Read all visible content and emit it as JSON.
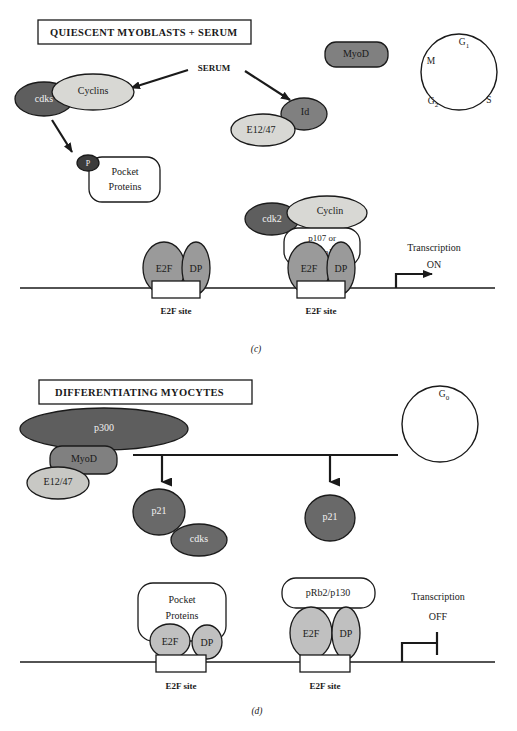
{
  "figure": {
    "panels": [
      {
        "letter": "(c)",
        "title": "QUIESCENT MYOBLASTS + SERUM"
      },
      {
        "letter": "(d)",
        "title": "DIFFERENTIATING MYOCYTES"
      }
    ],
    "caption_partial": ""
  },
  "panel_c": {
    "title": "QUIESCENT MYOBLASTS + SERUM",
    "letter": "(c)",
    "serum_label": "SERUM",
    "nodes": {
      "cdks": "cdks",
      "cyclins": "Cyclins",
      "phospho": "P",
      "pocket_proteins_line1": "Pocket",
      "pocket_proteins_line2": "Proteins",
      "e12_47": "E12/47",
      "id": "Id",
      "myod": "MyoD",
      "cdk2": "cdk2",
      "cyclin": "Cyclin",
      "pocket_variant_line1": "p107 or",
      "pocket_variant_line2": "pRb2/p130",
      "e2f_left": "E2F",
      "dp_left": "DP",
      "e2f_right": "E2F",
      "dp_right": "DP"
    },
    "dna": {
      "site_left": "E2F site",
      "site_right": "E2F site"
    },
    "transcription": {
      "line1": "Transcription",
      "line2": "ON",
      "state": "ON"
    },
    "cell_cycle": {
      "phases": [
        {
          "name": "G1",
          "text": "G",
          "sub": "1"
        },
        {
          "name": "S",
          "text": "S",
          "sub": ""
        },
        {
          "name": "G2",
          "text": "G",
          "sub": "2"
        },
        {
          "name": "M",
          "text": "M",
          "sub": ""
        }
      ]
    }
  },
  "panel_d": {
    "title": "DIFFERENTIATING MYOCYTES",
    "letter": "(d)",
    "nodes": {
      "p300": "p300",
      "myod": "MyoD",
      "e12_47": "E12/47",
      "p21_left": "p21",
      "cdks": "cdks",
      "p21_right": "p21",
      "pocket_proteins_line1": "Pocket",
      "pocket_proteins_line2": "Proteins",
      "prb2_p130": "pRb2/p130",
      "e2f_left": "E2F",
      "dp_left": "DP",
      "e2f_right": "E2F",
      "dp_right": "DP"
    },
    "dna": {
      "site_left": "E2F site",
      "site_right": "E2F site"
    },
    "transcription": {
      "line1": "Transcription",
      "line2": "OFF",
      "state": "OFF"
    },
    "cell_cycle": {
      "phases": [
        {
          "name": "G0",
          "text": "G",
          "sub": "0"
        }
      ]
    }
  },
  "colors": {
    "background": "#ffffff",
    "stroke": "#1a1a1a",
    "fill_dark": "#5e5e5e",
    "fill_mid": "#808080",
    "fill_light": "#b8b8b8",
    "fill_pale": "#d8d8d4",
    "fill_white": "#ffffff",
    "text_dark": "#1a1a1a",
    "text_light": "#f2f2f2"
  }
}
